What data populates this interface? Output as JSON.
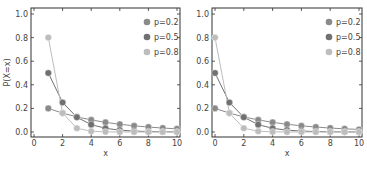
{
  "chart_data": [
    {
      "type": "line",
      "title": "",
      "xlabel": "x",
      "ylabel": "P(X=x)",
      "xlim": [
        0,
        10
      ],
      "ylim": [
        0,
        1.0
      ],
      "xticks": [
        "0",
        "2",
        "4",
        "6",
        "8",
        "10"
      ],
      "yticks": [
        "0.0",
        "0.2",
        "0.4",
        "0.6",
        "0.8",
        "1.0"
      ],
      "grid": false,
      "legend_position": "upper right",
      "x": [
        1,
        2,
        3,
        4,
        5,
        6,
        7,
        8,
        9,
        10
      ],
      "series": [
        {
          "name": "p=0.2",
          "color": "#8a8a8a",
          "values": [
            0.2,
            0.16,
            0.128,
            0.1024,
            0.0819,
            0.0655,
            0.0524,
            0.0419,
            0.0336,
            0.0268
          ]
        },
        {
          "name": "p=0.5",
          "color": "#707070",
          "values": [
            0.5,
            0.25,
            0.125,
            0.0625,
            0.0313,
            0.0156,
            0.0078,
            0.0039,
            0.002,
            0.001
          ]
        },
        {
          "name": "p=0.8",
          "color": "#bdbdbd",
          "values": [
            0.8,
            0.16,
            0.032,
            0.0064,
            0.0013,
            0.0003,
            0.0001,
            0.0,
            0.0,
            0.0
          ]
        }
      ]
    },
    {
      "type": "line",
      "title": "",
      "xlabel": "x",
      "ylabel": "",
      "xlim": [
        0,
        10
      ],
      "ylim": [
        0,
        1.0
      ],
      "xticks": [
        "0",
        "2",
        "4",
        "6",
        "8",
        "10"
      ],
      "yticks": [
        "0.0",
        "0.2",
        "0.4",
        "0.6",
        "0.8",
        "1.0"
      ],
      "grid": false,
      "legend_position": "upper right",
      "x": [
        0,
        1,
        2,
        3,
        4,
        5,
        6,
        7,
        8,
        9,
        10
      ],
      "series": [
        {
          "name": "p=0.2",
          "color": "#8a8a8a",
          "values": [
            0.2,
            0.16,
            0.128,
            0.1024,
            0.0819,
            0.0655,
            0.0524,
            0.0419,
            0.0336,
            0.0268,
            0.0215
          ]
        },
        {
          "name": "p=0.5",
          "color": "#707070",
          "values": [
            0.5,
            0.25,
            0.125,
            0.0625,
            0.0313,
            0.0156,
            0.0078,
            0.0039,
            0.002,
            0.001,
            0.0005
          ]
        },
        {
          "name": "p=0.8",
          "color": "#bdbdbd",
          "values": [
            0.8,
            0.16,
            0.032,
            0.0064,
            0.0013,
            0.0003,
            0.0001,
            0.0,
            0.0,
            0.0,
            0.0
          ]
        }
      ]
    }
  ]
}
